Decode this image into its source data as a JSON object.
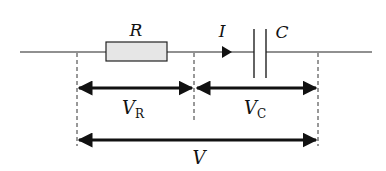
{
  "diagram": {
    "components": {
      "resistor": {
        "label": "R"
      },
      "capacitor": {
        "label": "C"
      },
      "current": {
        "label": "I"
      }
    },
    "voltages": {
      "resistor": {
        "symbol": "V",
        "subscript": "R"
      },
      "capacitor": {
        "symbol": "V",
        "subscript": "C"
      },
      "total": {
        "symbol": "V"
      }
    },
    "colors": {
      "line": "#222222",
      "resistor_fill": "#e6e6e6",
      "background": "#ffffff"
    }
  }
}
